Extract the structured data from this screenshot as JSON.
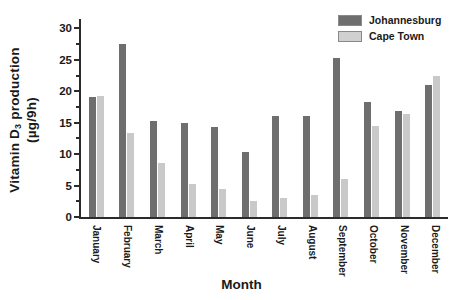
{
  "chart_data": {
    "type": "bar",
    "title": "",
    "xlabel": "Month",
    "ylabel": "Vitamin D3 production (µg/9h)",
    "ylabel_main": "Vitamin D",
    "ylabel_sub": "3",
    "ylabel_rest": " production",
    "ylabel_units": "(µg/9h)",
    "categories": [
      "January",
      "February",
      "March",
      "April",
      "May",
      "June",
      "July",
      "August",
      "September",
      "October",
      "November",
      "December"
    ],
    "series": [
      {
        "name": "Johannesburg",
        "color": "#6e6e6e",
        "values": [
          19.1,
          27.6,
          15.3,
          15.0,
          14.4,
          10.3,
          16.0,
          16.1,
          25.3,
          18.3,
          16.9,
          21.0
        ]
      },
      {
        "name": "Cape Town",
        "color": "#c9c9c9",
        "values": [
          19.2,
          13.3,
          8.6,
          5.2,
          4.4,
          2.6,
          3.0,
          3.5,
          6.1,
          14.5,
          16.4,
          22.5
        ]
      }
    ],
    "ylim": [
      0,
      31.5
    ],
    "yticks": [
      0,
      5,
      10,
      15,
      20,
      25,
      30
    ],
    "ytick_labels": [
      "0",
      "5",
      "10",
      "15",
      "20",
      "25",
      "30"
    ],
    "grid": false,
    "legend_position": "top-right"
  },
  "legend": {
    "entries": [
      {
        "label": "Johannesburg",
        "color": "#6e6e6e"
      },
      {
        "label": "Cape Town",
        "color": "#d0d0d0"
      }
    ]
  }
}
